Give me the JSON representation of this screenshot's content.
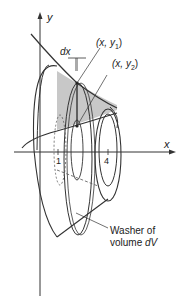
{
  "diagram": {
    "axes": {
      "x_label": "x",
      "y_label": "y"
    },
    "ticks": [
      {
        "label": "1"
      },
      {
        "label": "4"
      }
    ],
    "labels": {
      "dx": "dx",
      "point1": "(x, y",
      "point1_sub": "1",
      "point1_close": ")",
      "point2": "(x, y",
      "point2_sub": "2",
      "point2_close": ")",
      "washer_line1": "Washer of",
      "washer_line2": "volume ",
      "washer_dv": "dV"
    },
    "colors": {
      "stroke": "#333333",
      "shade": "#c8c8c8",
      "background": "#ffffff"
    }
  }
}
